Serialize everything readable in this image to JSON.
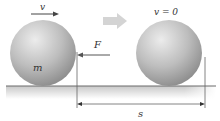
{
  "diagram": {
    "labels": {
      "velocity_initial": "v",
      "velocity_final": "v = 0",
      "force": "F",
      "mass": "m",
      "distance": "s"
    },
    "objects": [
      {
        "id": "ball-initial",
        "label": "m",
        "state": "moving",
        "velocity_label": "v"
      },
      {
        "id": "ball-final",
        "state": "at rest",
        "velocity_label": "v = 0"
      }
    ],
    "arrows": {
      "velocity": {
        "direction": "right",
        "label": "v"
      },
      "force": {
        "direction": "left",
        "label": "F"
      },
      "transition": {
        "direction": "right"
      },
      "displacement": {
        "direction": "both",
        "label": "s"
      }
    },
    "colors": {
      "ball_light": "#e6e6e6",
      "ball_dark": "#8c8c8c",
      "ground_line": "#6b6b6b",
      "ground_shade": "#cfcfcf",
      "transition_arrow": "#d4d4d4",
      "ink": "#333333"
    }
  }
}
